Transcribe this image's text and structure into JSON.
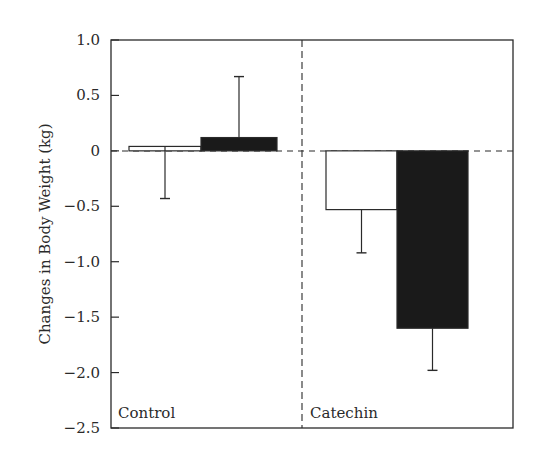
{
  "chart_data": {
    "type": "bar",
    "title": "",
    "xlabel": "",
    "ylabel": "Changes in Body Weight (kg)",
    "ylim": [
      -2.5,
      1.0
    ],
    "yticks": [
      1.0,
      0.5,
      0,
      -0.5,
      -1.0,
      -1.5,
      -2.0,
      -2.5
    ],
    "ytick_labels": [
      "1.0",
      "0.5",
      "0",
      "−0.5",
      "−1.0",
      "−1.5",
      "−2.0",
      "−2.5"
    ],
    "grid": false,
    "legend": null,
    "categories": [
      "Control",
      "Catechin"
    ],
    "series": [
      {
        "name": "White bar",
        "fill": "#ffffff",
        "values": [
          0.04,
          -0.53
        ],
        "error_bars": [
          -0.47,
          -0.39
        ],
        "error_direction": [
          "down",
          "down"
        ]
      },
      {
        "name": "Black bar",
        "fill": "#1a1a1a",
        "values": [
          0.12,
          -1.6
        ],
        "error_bars": [
          0.55,
          -0.38
        ],
        "error_direction": [
          "up",
          "down"
        ]
      }
    ],
    "annotations": [
      "Control",
      "Catechin"
    ],
    "group_divider": "dashed vertical line between Control and Catechin",
    "zero_line": "dashed horizontal line at 0"
  },
  "labels": {
    "ylabel": "Changes in Body Weight (kg)",
    "group_control": "Control",
    "group_catechin": "Catechin"
  },
  "colors": {
    "axis": "#2a2a2a",
    "bar_white": "#ffffff",
    "bar_black": "#1a1a1a"
  }
}
